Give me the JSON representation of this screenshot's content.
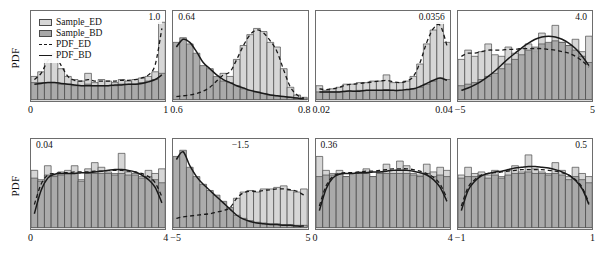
{
  "figure": {
    "ylabel": "PDF",
    "legend": [
      {
        "key": "sample_ed",
        "label": "Sample_ED",
        "kind": "swatch-light"
      },
      {
        "key": "sample_bd",
        "label": "Sample_BD",
        "kind": "swatch-dark"
      },
      {
        "key": "pdf_ed",
        "label": "PDF_ED",
        "kind": "line-dashed"
      },
      {
        "key": "pdf_bd",
        "label": "PDF_BD",
        "kind": "line-solid"
      }
    ],
    "colors": {
      "sample_ed_fill": "#d6d6d6",
      "sample_bd_fill": "#a8a8a8",
      "bar_edge": "#4a4a4a",
      "pdf_line": "#1a1a1a",
      "frame": "#6d6d6d"
    }
  },
  "chart_data": {
    "type": "bar",
    "title": "",
    "ylabel": "PDF",
    "grid": false,
    "legend_position": "top-left of panel 1",
    "series_names": [
      "Sample_ED",
      "Sample_BD",
      "PDF_ED",
      "PDF_BD"
    ],
    "panels": [
      {
        "index": 1,
        "xlabel_theta": "θ₁",
        "xlabel_var": "x₂",
        "xlabel": "θ₁: x₂",
        "annotation": "1.0",
        "annotation_pos": "right",
        "xlim": [
          0,
          1
        ],
        "xticks": [
          "0",
          "1"
        ],
        "bin_centers": [
          0.025,
          0.075,
          0.125,
          0.175,
          0.225,
          0.275,
          0.325,
          0.375,
          0.425,
          0.475,
          0.525,
          0.575,
          0.625,
          0.675,
          0.725,
          0.775,
          0.825,
          0.875,
          0.925,
          0.975
        ],
        "sample_ed": [
          0.3,
          0.36,
          0.52,
          0.6,
          0.4,
          0.3,
          0.26,
          0.24,
          0.34,
          0.22,
          0.26,
          0.24,
          0.22,
          0.26,
          0.24,
          0.26,
          0.28,
          0.3,
          0.36,
          1.0
        ],
        "sample_bd": [
          0.22,
          0.22,
          0.22,
          0.22,
          0.2,
          0.2,
          0.18,
          0.18,
          0.2,
          0.18,
          0.18,
          0.18,
          0.18,
          0.2,
          0.2,
          0.2,
          0.22,
          0.24,
          0.26,
          0.34
        ],
        "pdf_ed": [
          0.26,
          0.34,
          0.5,
          0.58,
          0.44,
          0.3,
          0.25,
          0.24,
          0.26,
          0.24,
          0.24,
          0.24,
          0.24,
          0.25,
          0.25,
          0.26,
          0.28,
          0.32,
          0.45,
          0.92
        ],
        "pdf_bd": [
          0.2,
          0.21,
          0.22,
          0.22,
          0.21,
          0.2,
          0.19,
          0.18,
          0.18,
          0.18,
          0.18,
          0.18,
          0.19,
          0.19,
          0.2,
          0.2,
          0.21,
          0.23,
          0.26,
          0.32
        ]
      },
      {
        "index": 2,
        "xlabel_theta": "θ₂",
        "xlabel_var": "μ₁",
        "xlabel": "θ₂: μ₁",
        "annotation": "0.64",
        "annotation_pos": "left",
        "xlim": [
          0.6,
          0.8
        ],
        "xticks": [
          "0.6",
          "0.8"
        ],
        "bin_centers": [
          0.605,
          0.615,
          0.625,
          0.635,
          0.645,
          0.655,
          0.665,
          0.675,
          0.685,
          0.695,
          0.705,
          0.715,
          0.725,
          0.735,
          0.745,
          0.755,
          0.765,
          0.775,
          0.785,
          0.795
        ],
        "sample_ed": [
          0.05,
          0.05,
          0.06,
          0.08,
          0.1,
          0.14,
          0.22,
          0.34,
          0.3,
          0.52,
          0.7,
          0.84,
          0.92,
          0.88,
          0.74,
          0.68,
          0.4,
          0.16,
          0.06,
          0.03
        ],
        "sample_bd": [
          0.74,
          0.8,
          0.72,
          0.6,
          0.44,
          0.4,
          0.3,
          0.24,
          0.22,
          0.18,
          0.14,
          0.12,
          0.1,
          0.08,
          0.06,
          0.05,
          0.04,
          0.03,
          0.02,
          0.01
        ],
        "pdf_ed": [
          0.04,
          0.05,
          0.06,
          0.08,
          0.11,
          0.16,
          0.24,
          0.32,
          0.36,
          0.52,
          0.7,
          0.84,
          0.9,
          0.86,
          0.76,
          0.62,
          0.38,
          0.16,
          0.06,
          0.02
        ],
        "pdf_bd": [
          0.68,
          0.78,
          0.74,
          0.62,
          0.48,
          0.4,
          0.32,
          0.26,
          0.22,
          0.18,
          0.15,
          0.12,
          0.1,
          0.08,
          0.06,
          0.05,
          0.04,
          0.03,
          0.02,
          0.01
        ]
      },
      {
        "index": 3,
        "xlabel_theta": "θ₃",
        "xlabel_var": "σ₁²",
        "xlabel": "θ₃: σ₁²",
        "annotation": "0.0356",
        "annotation_pos": "right",
        "xlim": [
          0.02,
          0.04
        ],
        "xticks": [
          "0.02",
          "0.04"
        ],
        "bin_centers": [
          0.0205,
          0.0215,
          0.0225,
          0.0235,
          0.0245,
          0.0255,
          0.0265,
          0.0275,
          0.0285,
          0.0295,
          0.0305,
          0.0315,
          0.0325,
          0.0335,
          0.0345,
          0.0355,
          0.0365,
          0.0375,
          0.0385,
          0.0395
        ],
        "sample_ed": [
          0.18,
          0.12,
          0.14,
          0.16,
          0.2,
          0.2,
          0.22,
          0.22,
          0.24,
          0.24,
          0.32,
          0.22,
          0.22,
          0.24,
          0.3,
          0.46,
          0.72,
          0.9,
          1.0,
          0.74
        ],
        "sample_bd": [
          0.1,
          0.1,
          0.1,
          0.1,
          0.11,
          0.11,
          0.12,
          0.12,
          0.12,
          0.12,
          0.13,
          0.12,
          0.12,
          0.13,
          0.14,
          0.16,
          0.2,
          0.24,
          0.28,
          0.26
        ],
        "pdf_ed": [
          0.14,
          0.13,
          0.14,
          0.16,
          0.19,
          0.2,
          0.21,
          0.22,
          0.23,
          0.24,
          0.25,
          0.23,
          0.22,
          0.24,
          0.3,
          0.48,
          0.74,
          0.92,
          0.96,
          0.7
        ],
        "pdf_bd": [
          0.1,
          0.1,
          0.1,
          0.1,
          0.11,
          0.11,
          0.11,
          0.12,
          0.12,
          0.12,
          0.12,
          0.12,
          0.12,
          0.13,
          0.14,
          0.17,
          0.21,
          0.25,
          0.28,
          0.25
        ]
      },
      {
        "index": 4,
        "xlabel_theta": "θ₄",
        "xlabel_var": "μ₄",
        "xlabel": "θ₄: μ₄",
        "annotation": "4.0",
        "annotation_pos": "right",
        "xlim": [
          -5,
          5
        ],
        "xticks": [
          "−5",
          "5"
        ],
        "bin_centers": [
          -4.75,
          -4.25,
          -3.75,
          -3.25,
          -2.75,
          -2.25,
          -1.75,
          -1.25,
          -0.75,
          -0.25,
          0.25,
          0.75,
          1.25,
          1.75,
          2.25,
          2.75,
          3.25,
          3.75,
          4.25,
          4.75
        ],
        "sample_ed": [
          0.52,
          0.64,
          0.56,
          0.62,
          0.72,
          0.58,
          0.56,
          0.68,
          0.6,
          0.66,
          0.72,
          0.62,
          0.86,
          0.72,
          0.96,
          0.74,
          0.7,
          0.78,
          0.62,
          0.82
        ],
        "sample_bd": [
          0.18,
          0.2,
          0.22,
          0.26,
          0.3,
          0.34,
          0.4,
          0.46,
          0.52,
          0.58,
          0.64,
          0.68,
          0.72,
          0.74,
          0.76,
          0.74,
          0.7,
          0.64,
          0.56,
          0.48
        ],
        "pdf_ed": [
          0.56,
          0.6,
          0.6,
          0.62,
          0.64,
          0.64,
          0.64,
          0.65,
          0.65,
          0.66,
          0.66,
          0.66,
          0.66,
          0.65,
          0.64,
          0.62,
          0.6,
          0.56,
          0.5,
          0.42
        ],
        "pdf_bd": [
          0.12,
          0.15,
          0.19,
          0.24,
          0.3,
          0.37,
          0.45,
          0.53,
          0.6,
          0.67,
          0.73,
          0.78,
          0.81,
          0.82,
          0.81,
          0.78,
          0.73,
          0.66,
          0.56,
          0.44
        ]
      },
      {
        "index": 5,
        "xlabel_theta": "θ₅",
        "xlabel_var": "σ₄²",
        "xlabel": "θ₅: σ₄²",
        "annotation": "0.04",
        "annotation_pos": "left",
        "xlim": [
          0,
          4
        ],
        "xticks": [
          "0",
          "4"
        ],
        "bin_centers": [
          0.1,
          0.3,
          0.5,
          0.7,
          0.9,
          1.1,
          1.3,
          1.5,
          1.7,
          1.9,
          2.1,
          2.3,
          2.5,
          2.7,
          2.9,
          3.1,
          3.3,
          3.5,
          3.7,
          3.9
        ],
        "sample_ed": [
          0.74,
          0.62,
          0.8,
          0.68,
          0.72,
          0.74,
          0.8,
          0.62,
          0.76,
          0.84,
          0.78,
          0.72,
          0.7,
          0.96,
          0.72,
          0.7,
          0.66,
          0.74,
          0.7,
          0.76
        ],
        "sample_bd": [
          0.64,
          0.6,
          0.68,
          0.66,
          0.68,
          0.7,
          0.7,
          0.6,
          0.7,
          0.7,
          0.7,
          0.7,
          0.68,
          0.7,
          0.68,
          0.68,
          0.64,
          0.66,
          0.62,
          0.58
        ],
        "pdf_ed": [
          0.3,
          0.56,
          0.68,
          0.7,
          0.71,
          0.71,
          0.72,
          0.72,
          0.72,
          0.73,
          0.73,
          0.74,
          0.74,
          0.74,
          0.73,
          0.72,
          0.7,
          0.66,
          0.58,
          0.4
        ],
        "pdf_bd": [
          0.18,
          0.48,
          0.64,
          0.69,
          0.7,
          0.7,
          0.7,
          0.71,
          0.71,
          0.72,
          0.73,
          0.74,
          0.75,
          0.75,
          0.74,
          0.72,
          0.68,
          0.62,
          0.52,
          0.32
        ]
      },
      {
        "index": 6,
        "xlabel_theta": "θ₆",
        "xlabel_var": "μ₅",
        "xlabel": "θ₆: μ₅",
        "annotation": "−1.5",
        "annotation_pos": "center",
        "xlim": [
          -5,
          5
        ],
        "xticks": [
          "−5",
          "5"
        ],
        "bin_centers": [
          -4.75,
          -4.25,
          -3.75,
          -3.25,
          -2.75,
          -2.25,
          -1.75,
          -1.25,
          -0.75,
          -0.25,
          0.25,
          0.75,
          1.25,
          1.75,
          2.25,
          2.75,
          3.25,
          3.75,
          4.25,
          4.75
        ],
        "sample_ed": [
          0.12,
          0.14,
          0.16,
          0.16,
          0.18,
          0.18,
          0.2,
          0.22,
          0.24,
          0.38,
          0.46,
          0.48,
          0.46,
          0.5,
          0.5,
          0.52,
          0.54,
          0.48,
          0.46,
          0.5
        ],
        "sample_bd": [
          0.92,
          1.0,
          0.78,
          0.66,
          0.56,
          0.48,
          0.42,
          0.34,
          0.26,
          0.16,
          0.12,
          0.09,
          0.07,
          0.06,
          0.05,
          0.05,
          0.04,
          0.04,
          0.03,
          0.03
        ],
        "pdf_ed": [
          0.12,
          0.14,
          0.15,
          0.16,
          0.17,
          0.18,
          0.2,
          0.22,
          0.26,
          0.38,
          0.45,
          0.47,
          0.47,
          0.48,
          0.49,
          0.5,
          0.5,
          0.49,
          0.47,
          0.42
        ],
        "pdf_bd": [
          0.88,
          0.98,
          0.8,
          0.66,
          0.56,
          0.48,
          0.4,
          0.32,
          0.24,
          0.16,
          0.11,
          0.08,
          0.06,
          0.05,
          0.04,
          0.04,
          0.03,
          0.03,
          0.02,
          0.02
        ]
      },
      {
        "index": 7,
        "xlabel_theta": "θ₇",
        "xlabel_var": "σ₅²",
        "xlabel": "θ₇: σ₅²",
        "annotation": "0.36",
        "annotation_pos": "left",
        "xlim": [
          0,
          4
        ],
        "xticks": [
          "0",
          "4"
        ],
        "bin_centers": [
          0.1,
          0.3,
          0.5,
          0.7,
          0.9,
          1.1,
          1.3,
          1.5,
          1.7,
          1.9,
          2.1,
          2.3,
          2.5,
          2.7,
          2.9,
          3.1,
          3.3,
          3.5,
          3.7,
          3.9
        ],
        "sample_ed": [
          0.92,
          0.74,
          0.7,
          0.74,
          0.66,
          0.7,
          0.72,
          0.76,
          0.66,
          0.72,
          0.82,
          0.74,
          0.86,
          0.8,
          0.7,
          0.68,
          0.82,
          0.72,
          0.78,
          0.74
        ],
        "sample_bd": [
          0.66,
          0.68,
          0.68,
          0.7,
          0.66,
          0.7,
          0.7,
          0.7,
          0.66,
          0.7,
          0.7,
          0.7,
          0.7,
          0.7,
          0.68,
          0.66,
          0.7,
          0.66,
          0.68,
          0.66
        ],
        "pdf_ed": [
          0.28,
          0.54,
          0.66,
          0.7,
          0.71,
          0.71,
          0.72,
          0.73,
          0.73,
          0.74,
          0.75,
          0.76,
          0.76,
          0.76,
          0.75,
          0.73,
          0.7,
          0.65,
          0.56,
          0.38
        ],
        "pdf_bd": [
          0.22,
          0.5,
          0.64,
          0.69,
          0.7,
          0.7,
          0.71,
          0.71,
          0.72,
          0.72,
          0.73,
          0.74,
          0.74,
          0.74,
          0.73,
          0.71,
          0.68,
          0.62,
          0.52,
          0.34
        ]
      },
      {
        "index": 8,
        "xlabel_theta": "θ₈",
        "xlabel_var": "ρ",
        "xlabel": "θ₈: ρ",
        "annotation": "0.5",
        "annotation_pos": "right",
        "xlim": [
          -1,
          1
        ],
        "xticks": [
          "−1",
          "1"
        ],
        "bin_centers": [
          -0.95,
          -0.85,
          -0.75,
          -0.65,
          -0.55,
          -0.45,
          -0.35,
          -0.25,
          -0.15,
          -0.05,
          0.05,
          0.15,
          0.25,
          0.35,
          0.45,
          0.55,
          0.65,
          0.75,
          0.85,
          0.95
        ],
        "sample_ed": [
          0.68,
          0.78,
          0.7,
          0.72,
          0.68,
          0.74,
          0.66,
          0.74,
          0.8,
          0.72,
          0.94,
          0.76,
          0.72,
          0.7,
          0.84,
          0.74,
          0.66,
          0.78,
          0.7,
          0.66
        ],
        "sample_bd": [
          0.64,
          0.66,
          0.66,
          0.68,
          0.64,
          0.68,
          0.64,
          0.68,
          0.7,
          0.7,
          0.72,
          0.7,
          0.7,
          0.68,
          0.7,
          0.68,
          0.62,
          0.66,
          0.62,
          0.58
        ],
        "pdf_ed": [
          0.28,
          0.52,
          0.62,
          0.68,
          0.7,
          0.71,
          0.72,
          0.73,
          0.74,
          0.75,
          0.75,
          0.75,
          0.75,
          0.74,
          0.73,
          0.71,
          0.68,
          0.62,
          0.52,
          0.32
        ],
        "pdf_bd": [
          0.22,
          0.48,
          0.6,
          0.67,
          0.7,
          0.72,
          0.73,
          0.75,
          0.77,
          0.78,
          0.79,
          0.79,
          0.78,
          0.77,
          0.75,
          0.72,
          0.68,
          0.61,
          0.5,
          0.3
        ]
      }
    ]
  }
}
